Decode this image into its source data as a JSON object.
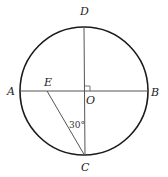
{
  "diagram": {
    "type": "geometry",
    "circle": {
      "center": "O",
      "cx": 84,
      "cy": 91,
      "r": 64
    },
    "points": {
      "A": {
        "label": "A",
        "x": 20,
        "y": 91
      },
      "B": {
        "label": "B",
        "x": 148,
        "y": 91
      },
      "D": {
        "label": "D",
        "x": 84,
        "y": 27
      },
      "C": {
        "label": "C",
        "x": 85,
        "y": 156
      },
      "O": {
        "label": "O",
        "x": 84,
        "y": 91
      },
      "E": {
        "label": "E",
        "x": 47,
        "y": 91
      }
    },
    "segments": [
      "AB",
      "DC",
      "EC"
    ],
    "right_angle_at": "O",
    "angle_label": "30°",
    "angle_at": "C",
    "colors": {
      "circle": "#1a1a1a",
      "lines": "#555555",
      "text": "#222222"
    }
  }
}
